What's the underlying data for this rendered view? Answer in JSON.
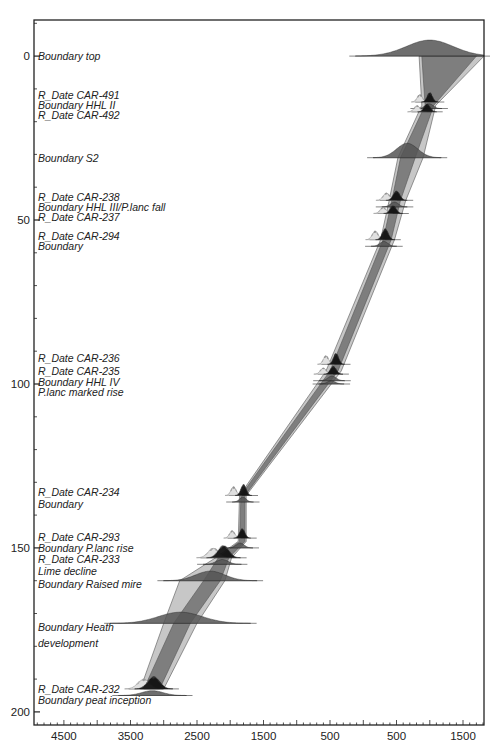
{
  "chart_data": {
    "type": "area",
    "title": "",
    "xlabel": "",
    "ylabel": "",
    "x_unit": "calendar year (negative = BC, positive = AD)",
    "y_unit": "depth",
    "xlim": [
      -4950,
      1815
    ],
    "ylim": [
      -11,
      204
    ],
    "y_inverted": true,
    "x_ticks": [
      {
        "value": -4500,
        "label": "4500"
      },
      {
        "value": -3500,
        "label": "3500"
      },
      {
        "value": -2500,
        "label": "2500"
      },
      {
        "value": -1500,
        "label": "1500"
      },
      {
        "value": -500,
        "label": "500"
      },
      {
        "value": 500,
        "label": "500"
      },
      {
        "value": 1500,
        "label": "1500"
      }
    ],
    "x_minor_step": 100,
    "x_mid_step": 500,
    "y_ticks": [
      {
        "value": 0,
        "label": "0"
      },
      {
        "value": 50,
        "label": "50"
      },
      {
        "value": 100,
        "label": "100"
      },
      {
        "value": 150,
        "label": "150"
      },
      {
        "value": 200,
        "label": "200"
      }
    ],
    "y_minor_step": 10,
    "envelope_95": [
      {
        "depth": 0,
        "from": 840,
        "to": 1815
      },
      {
        "depth": 15,
        "from": 880,
        "to": 1090
      },
      {
        "depth": 31,
        "from": 520,
        "to": 900
      },
      {
        "depth": 44,
        "from": 390,
        "to": 640
      },
      {
        "depth": 56,
        "from": 260,
        "to": 470
      },
      {
        "depth": 96,
        "from": -560,
        "to": -330
      },
      {
        "depth": 134,
        "from": -1860,
        "to": -1760
      },
      {
        "depth": 148,
        "from": -1880,
        "to": -1760
      },
      {
        "depth": 153,
        "from": -2220,
        "to": -1980
      },
      {
        "depth": 160,
        "from": -2760,
        "to": -2080
      },
      {
        "depth": 173,
        "from": -3000,
        "to": -2500
      },
      {
        "depth": 193,
        "from": -3350,
        "to": -3000
      }
    ],
    "envelope_68": [
      {
        "depth": 0,
        "from": 880,
        "to": 1700
      },
      {
        "depth": 15,
        "from": 930,
        "to": 1060
      },
      {
        "depth": 31,
        "from": 560,
        "to": 780
      },
      {
        "depth": 44,
        "from": 430,
        "to": 560
      },
      {
        "depth": 56,
        "from": 300,
        "to": 420
      },
      {
        "depth": 96,
        "from": -500,
        "to": -380
      },
      {
        "depth": 134,
        "from": -1840,
        "to": -1780
      },
      {
        "depth": 148,
        "from": -1860,
        "to": -1780
      },
      {
        "depth": 153,
        "from": -2180,
        "to": -2020
      },
      {
        "depth": 160,
        "from": -2400,
        "to": -2150
      },
      {
        "depth": 173,
        "from": -2850,
        "to": -2600
      },
      {
        "depth": 193,
        "from": -3300,
        "to": -3060
      }
    ],
    "distributions": [
      {
        "name": "Boundary top",
        "kind": "boundary",
        "depth": 0,
        "mean": 1000,
        "sd": 350,
        "height": 10
      },
      {
        "name": "R_Date CAR-491",
        "kind": "date",
        "depth": 14,
        "mean": 1000,
        "sd": 40,
        "height": 6
      },
      {
        "name": "Boundary HHL II",
        "kind": "boundary",
        "depth": 16,
        "mean": 990,
        "sd": 60,
        "height": 3
      },
      {
        "name": "R_Date CAR-492",
        "kind": "date",
        "depth": 17,
        "mean": 960,
        "sd": 45,
        "height": 5
      },
      {
        "name": "Boundary S2",
        "kind": "boundary",
        "depth": 31,
        "mean": 660,
        "sd": 160,
        "height": 9
      },
      {
        "name": "R_Date CAR-238",
        "kind": "date",
        "depth": 44,
        "mean": 500,
        "sd": 50,
        "height": 6
      },
      {
        "name": "Boundary HHL III/P.lanc fall",
        "kind": "boundary",
        "depth": 46,
        "mean": 470,
        "sd": 60,
        "height": 3
      },
      {
        "name": "R_Date CAR-237",
        "kind": "date",
        "depth": 48,
        "mean": 450,
        "sd": 45,
        "height": 5
      },
      {
        "name": "R_Date CAR-294",
        "kind": "date",
        "depth": 56,
        "mean": 330,
        "sd": 45,
        "height": 7
      },
      {
        "name": "Boundary",
        "kind": "boundary",
        "depth": 58,
        "mean": 310,
        "sd": 60,
        "height": 3
      },
      {
        "name": "R_Date CAR-236",
        "kind": "date",
        "depth": 94,
        "mean": -410,
        "sd": 40,
        "height": 7
      },
      {
        "name": "R_Date CAR-235",
        "kind": "date",
        "depth": 97,
        "mean": -450,
        "sd": 45,
        "height": 5
      },
      {
        "name": "Boundary HHL IV",
        "kind": "boundary",
        "depth": 99,
        "mean": -470,
        "sd": 60,
        "height": 3
      },
      {
        "name": "P.lanc marked rise",
        "kind": "boundary",
        "depth": 100,
        "mean": -480,
        "sd": 60,
        "height": 2
      },
      {
        "name": "R_Date CAR-234",
        "kind": "date",
        "depth": 134,
        "mean": -1800,
        "sd": 40,
        "height": 7
      },
      {
        "name": "Boundary",
        "kind": "boundary",
        "depth": 136,
        "mean": -1810,
        "sd": 50,
        "height": 3
      },
      {
        "name": "R_Date CAR-293",
        "kind": "date",
        "depth": 147,
        "mean": -1820,
        "sd": 40,
        "height": 6
      },
      {
        "name": "Boundary P.lanc rise",
        "kind": "boundary",
        "depth": 150,
        "mean": -1850,
        "sd": 60,
        "height": 3
      },
      {
        "name": "R_Date CAR-233",
        "kind": "date",
        "depth": 153,
        "mean": -2100,
        "sd": 80,
        "height": 8
      },
      {
        "name": "Lime decline",
        "kind": "boundary",
        "depth": 155,
        "mean": -2120,
        "sd": 90,
        "height": 3
      },
      {
        "name": "Boundary Raised mire",
        "kind": "boundary",
        "depth": 160,
        "mean": -2300,
        "sd": 220,
        "height": 6
      },
      {
        "name": "Boundary Heath development",
        "kind": "boundary",
        "depth": 173,
        "mean": -2750,
        "sd": 330,
        "height": 7
      },
      {
        "name": "R_Date CAR-232",
        "kind": "date",
        "depth": 193,
        "mean": -3150,
        "sd": 90,
        "height": 8
      },
      {
        "name": "Boundary peat inception",
        "kind": "boundary",
        "depth": 195,
        "mean": -3170,
        "sd": 160,
        "height": 3
      }
    ],
    "annotations": [
      {
        "text": "Boundary top",
        "depth": 0
      },
      {
        "text": "R_Date CAR-491",
        "depth": 12
      },
      {
        "text": "Boundary HHL II",
        "depth": 15
      },
      {
        "text": "R_Date CAR-492",
        "depth": 18
      },
      {
        "text": "Boundary S2",
        "depth": 31
      },
      {
        "text": "R_Date CAR-238",
        "depth": 43
      },
      {
        "text": "Boundary HHL III/P.lanc fall",
        "depth": 46
      },
      {
        "text": "R_Date CAR-237",
        "depth": 49
      },
      {
        "text": "R_Date CAR-294",
        "depth": 55
      },
      {
        "text": "Boundary",
        "depth": 58
      },
      {
        "text": "R_Date CAR-236",
        "depth": 92
      },
      {
        "text": "R_Date CAR-235",
        "depth": 96
      },
      {
        "text": "Boundary HHL IV",
        "depth": 99.5
      },
      {
        "text": "P.lanc marked rise",
        "depth": 102.5
      },
      {
        "text": "R_Date CAR-234",
        "depth": 133
      },
      {
        "text": "Boundary",
        "depth": 136.5
      },
      {
        "text": "R_Date CAR-293",
        "depth": 146.5
      },
      {
        "text": "Boundary P.lanc rise",
        "depth": 150
      },
      {
        "text": "R_Date CAR-233",
        "depth": 153.5
      },
      {
        "text": "Lime decline",
        "depth": 157
      },
      {
        "text": "Boundary Raised mire",
        "depth": 161
      },
      {
        "text": "Boundary Heath",
        "depth": 174
      },
      {
        "text": "development",
        "depth": 179
      },
      {
        "text": "R_Date CAR-232",
        "depth": 193
      },
      {
        "text": "Boundary peat inception",
        "depth": 196.5
      }
    ],
    "grid": false,
    "legend": "none",
    "colors": {
      "envelope_95": "#c4c4c4",
      "envelope_68": "#7a7a7a",
      "boundary_fill": "#555555",
      "date_fill": "#111111",
      "unmodelled_fill": "#e0e0e0",
      "axis": "#222222"
    }
  }
}
